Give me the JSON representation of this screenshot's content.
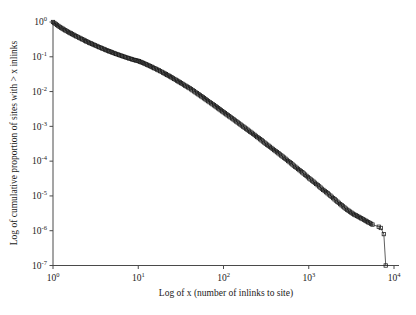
{
  "chart_data": {
    "type": "line",
    "title": "",
    "xlabel": "Log of x (number of inlinks to site)",
    "ylabel": "Log of cumulative proportion of sites with > x inlinks",
    "xscale": "log",
    "yscale": "log",
    "xlim": [
      1,
      10000
    ],
    "ylim": [
      1e-07,
      1
    ],
    "grid": false,
    "legend": null,
    "marker": "open-square",
    "line_style": "solid",
    "line_color": "#1a1a1a",
    "marker_color": "#1a1a1a",
    "xtick_labels": [
      "10^0",
      "10^1",
      "10^2",
      "10^3",
      "10^4"
    ],
    "xtick_mantissa": [
      "10",
      "10",
      "10",
      "10",
      "10"
    ],
    "xtick_exponents": [
      "0",
      "1",
      "2",
      "3",
      "4"
    ],
    "xtick_values": [
      1,
      10,
      100,
      1000,
      10000
    ],
    "ytick_labels": [
      "10^0",
      "10^-1",
      "10^-2",
      "10^-3",
      "10^-4",
      "10^-5",
      "10^-6",
      "10^-7"
    ],
    "ytick_mantissa": [
      "10",
      "10",
      "10",
      "10",
      "10",
      "10",
      "10",
      "10"
    ],
    "ytick_exponents": [
      "0",
      "-1",
      "-2",
      "-3",
      "-4",
      "-5",
      "-6",
      "-7"
    ],
    "ytick_values": [
      1,
      0.1,
      0.01,
      0.001,
      0.0001,
      1e-05,
      1e-06,
      1e-07
    ],
    "x": [
      1,
      1.2,
      1.5,
      1.8,
      2.2,
      2.6,
      3.1,
      3.7,
      4.4,
      5.2,
      6.2,
      7.4,
      8.8,
      10,
      12,
      14,
      17,
      20,
      24,
      28,
      33,
      40,
      47,
      56,
      66,
      79,
      93,
      110,
      131,
      155,
      184,
      218,
      259,
      307,
      364,
      432,
      513,
      608,
      721,
      855,
      1014,
      1203,
      1427,
      1692,
      2007,
      2381,
      2824,
      3350,
      3973,
      4713,
      5590,
      6631,
      7000,
      7600,
      8000
    ],
    "y": [
      1.0,
      0.72,
      0.52,
      0.41,
      0.32,
      0.26,
      0.215,
      0.178,
      0.149,
      0.127,
      0.109,
      0.094,
      0.082,
      0.076,
      0.063,
      0.053,
      0.042,
      0.034,
      0.0265,
      0.0212,
      0.0166,
      0.0125,
      0.0095,
      0.0071,
      0.0053,
      0.0039,
      0.0029,
      0.00215,
      0.00159,
      0.00117,
      0.00086,
      0.00063,
      0.00046,
      0.00033,
      0.00024,
      0.000175,
      0.000126,
      9e-05,
      6.4e-05,
      4.6e-05,
      3.2e-05,
      2.3e-05,
      1.6e-05,
      1.15e-05,
      8e-06,
      5.6e-06,
      4e-06,
      3e-06,
      2.4e-06,
      1.9e-06,
      1.5e-06,
      1.3e-06,
      1.2e-06,
      8e-07,
      1e-07
    ]
  },
  "axes": {
    "x_title": "Log of x (number of inlinks to site)",
    "y_title": "Log of cumulative proportion of sites with > x inlinks"
  }
}
